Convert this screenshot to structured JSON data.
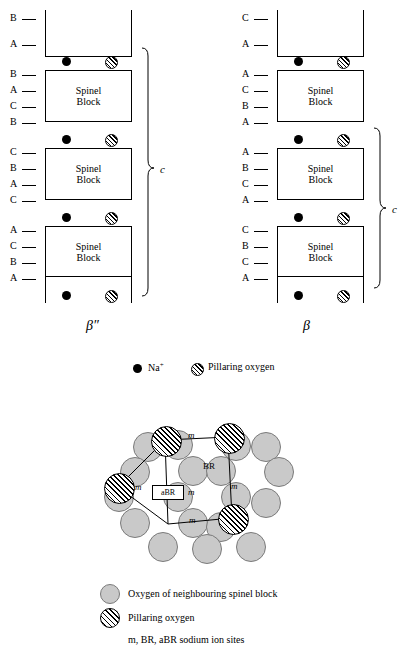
{
  "figure": {
    "left_structure": {
      "name": "beta-double-prime-alumina",
      "caption": "β″",
      "axis_label": "c",
      "block_label": "Spinel\nBlock",
      "block_label_line1": "Spinel",
      "block_label_line2": "Block",
      "layer_labels": [
        "B",
        "A",
        "B",
        "A",
        "C",
        "B",
        "C",
        "B",
        "A",
        "C",
        "A",
        "C",
        "B",
        "A"
      ]
    },
    "right_structure": {
      "name": "beta-alumina",
      "caption": "β",
      "axis_label": "c",
      "block_label_line1": "Spinel",
      "block_label_line2": "Block",
      "layer_labels": [
        "C",
        "A",
        "A",
        "C",
        "B",
        "A",
        "A",
        "B",
        "C",
        "A",
        "C",
        "B",
        "C",
        "A"
      ]
    },
    "legend_top": {
      "sodium_label": "Na",
      "sodium_charge": "+",
      "pillaring_label": "Pillaring oxygen"
    },
    "bottom_diagram": {
      "abr_label": "aBR",
      "br_label": "BR",
      "m_labels": [
        "m",
        "m",
        "m",
        "m",
        "m",
        "m"
      ]
    },
    "legend_bottom": {
      "item1": "Oxygen of neighbouring spinel block",
      "item2": "Pillaring oxygen",
      "item3": "m, BR, aBR sodium ion sites"
    },
    "colors": {
      "oxygen_fill": "#c9c9c9",
      "oxygen_stroke": "#7a7a7a",
      "line": "#000000"
    }
  }
}
